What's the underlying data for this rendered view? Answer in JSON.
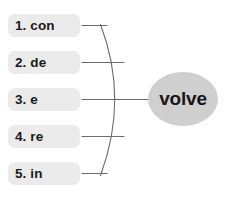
{
  "diagram": {
    "type": "word-building-brace-diagram",
    "root": {
      "text": "volve",
      "fill_color": "#cfcfcf",
      "text_color": "#171717"
    },
    "brace": {
      "stroke_color": "#6b6b6b",
      "stroke_width": 1
    },
    "items": [
      {
        "label": "1. con",
        "number": "1",
        "prefix": "con",
        "top": 14
      },
      {
        "label": "2. de",
        "number": "2",
        "prefix": "de",
        "top": 51
      },
      {
        "label": "3. e",
        "number": "3",
        "prefix": "e",
        "top": 88
      },
      {
        "label": "4. re",
        "number": "4",
        "prefix": "re",
        "top": 125
      },
      {
        "label": "5. in",
        "number": "5",
        "prefix": "in",
        "top": 162
      }
    ],
    "item_style": {
      "fill_color": "#ebebeb",
      "text_color": "#1a1a1a"
    }
  }
}
